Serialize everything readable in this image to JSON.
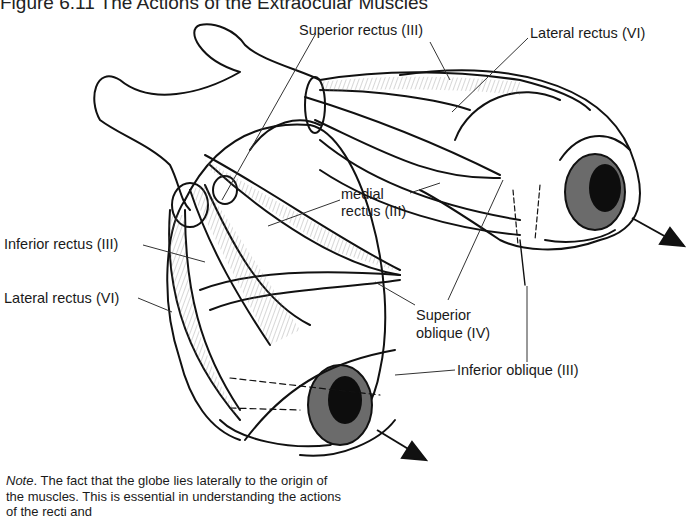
{
  "figure": {
    "title": "Figure 6.11 The Actions of the Extraocular Muscles"
  },
  "labels": {
    "superior_rectus": "Superior rectus (III)",
    "lateral_rectus_top": "Lateral rectus (VI)",
    "medial_rectus_line1": "medial",
    "medial_rectus_line2": "rectus (III)",
    "inferior_rectus": "Inferior rectus (III)",
    "lateral_rectus_left": "Lateral rectus (VI)",
    "superior_oblique_line1": "Superior",
    "superior_oblique_line2": "oblique (IV)",
    "inferior_oblique": "Inferior oblique (III)"
  },
  "note": {
    "lead": "Note",
    "text": ". The fact that the globe lies laterally to the origin of the muscles. This is essential in understanding the actions of the recti and"
  },
  "colors": {
    "line": "#111111",
    "iris": "#6b6b6b",
    "pupil": "#0d0d0d",
    "hatch": "#555555"
  }
}
